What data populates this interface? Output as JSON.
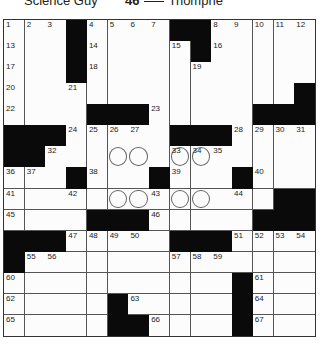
{
  "clue_strip": {
    "left_clue": {
      "text": "Science Guy"
    },
    "right_clue": {
      "number": "46",
      "blank": "___",
      "text": "Triomphe"
    }
  },
  "puzzle": {
    "rows": 15,
    "cols": 15,
    "colors": {
      "black": "#0a0a0a",
      "white": "#fcfcfc",
      "line": "#555555"
    },
    "grid": [
      "...#....##.....",
      "...#.....#.....",
      "...#...........",
      "..............#",
      "....###.....###",
      "###.....###....",
      "##.............",
      "...#...#...#...",
      ".............##",
      "....###.....###",
      "###.....###....",
      "#..............",
      "...........#...",
      ".....#.....#...",
      ".....##....#..."
    ],
    "numbers": [
      {
        "r": 0,
        "c": 0,
        "n": "1"
      },
      {
        "r": 0,
        "c": 1,
        "n": "2"
      },
      {
        "r": 0,
        "c": 2,
        "n": "3"
      },
      {
        "r": 0,
        "c": 4,
        "n": "4"
      },
      {
        "r": 0,
        "c": 5,
        "n": "5"
      },
      {
        "r": 0,
        "c": 6,
        "n": "6"
      },
      {
        "r": 0,
        "c": 7,
        "n": "7"
      },
      {
        "r": 0,
        "c": 10,
        "n": "8"
      },
      {
        "r": 0,
        "c": 11,
        "n": "9"
      },
      {
        "r": 0,
        "c": 12,
        "n": "10"
      },
      {
        "r": 0,
        "c": 13,
        "n": "11"
      },
      {
        "r": 0,
        "c": 14,
        "n": "12"
      },
      {
        "r": 1,
        "c": 0,
        "n": "13"
      },
      {
        "r": 1,
        "c": 4,
        "n": "14"
      },
      {
        "r": 1,
        "c": 8,
        "n": "15"
      },
      {
        "r": 1,
        "c": 10,
        "n": "16"
      },
      {
        "r": 2,
        "c": 0,
        "n": "17"
      },
      {
        "r": 2,
        "c": 4,
        "n": "18"
      },
      {
        "r": 2,
        "c": 9,
        "n": "19"
      },
      {
        "r": 3,
        "c": 0,
        "n": "20"
      },
      {
        "r": 3,
        "c": 3,
        "n": "21"
      },
      {
        "r": 4,
        "c": 0,
        "n": "22"
      },
      {
        "r": 4,
        "c": 7,
        "n": "23"
      },
      {
        "r": 5,
        "c": 3,
        "n": "24"
      },
      {
        "r": 5,
        "c": 4,
        "n": "25"
      },
      {
        "r": 5,
        "c": 5,
        "n": "26"
      },
      {
        "r": 5,
        "c": 6,
        "n": "27"
      },
      {
        "r": 5,
        "c": 11,
        "n": "28"
      },
      {
        "r": 5,
        "c": 12,
        "n": "29"
      },
      {
        "r": 5,
        "c": 13,
        "n": "30"
      },
      {
        "r": 5,
        "c": 14,
        "n": "31"
      },
      {
        "r": 6,
        "c": 2,
        "n": "32"
      },
      {
        "r": 6,
        "c": 8,
        "n": "33"
      },
      {
        "r": 6,
        "c": 9,
        "n": "34"
      },
      {
        "r": 6,
        "c": 10,
        "n": "35"
      },
      {
        "r": 7,
        "c": 0,
        "n": "36"
      },
      {
        "r": 7,
        "c": 1,
        "n": "37"
      },
      {
        "r": 7,
        "c": 4,
        "n": "38"
      },
      {
        "r": 7,
        "c": 8,
        "n": "39"
      },
      {
        "r": 7,
        "c": 12,
        "n": "40"
      },
      {
        "r": 8,
        "c": 0,
        "n": "41"
      },
      {
        "r": 8,
        "c": 3,
        "n": "42"
      },
      {
        "r": 8,
        "c": 7,
        "n": "43"
      },
      {
        "r": 8,
        "c": 11,
        "n": "44"
      },
      {
        "r": 9,
        "c": 0,
        "n": "45"
      },
      {
        "r": 9,
        "c": 7,
        "n": "46"
      },
      {
        "r": 10,
        "c": 3,
        "n": "47"
      },
      {
        "r": 10,
        "c": 4,
        "n": "48"
      },
      {
        "r": 10,
        "c": 5,
        "n": "49"
      },
      {
        "r": 10,
        "c": 6,
        "n": "50"
      },
      {
        "r": 10,
        "c": 11,
        "n": "51"
      },
      {
        "r": 10,
        "c": 12,
        "n": "52"
      },
      {
        "r": 10,
        "c": 13,
        "n": "53"
      },
      {
        "r": 10,
        "c": 14,
        "n": "54"
      },
      {
        "r": 11,
        "c": 1,
        "n": "55"
      },
      {
        "r": 11,
        "c": 2,
        "n": "56"
      },
      {
        "r": 11,
        "c": 8,
        "n": "57"
      },
      {
        "r": 11,
        "c": 9,
        "n": "58"
      },
      {
        "r": 11,
        "c": 10,
        "n": "59"
      },
      {
        "r": 12,
        "c": 0,
        "n": "60"
      },
      {
        "r": 12,
        "c": 12,
        "n": "61"
      },
      {
        "r": 13,
        "c": 0,
        "n": "62"
      },
      {
        "r": 13,
        "c": 6,
        "n": "63"
      },
      {
        "r": 13,
        "c": 12,
        "n": "64"
      },
      {
        "r": 14,
        "c": 0,
        "n": "65"
      },
      {
        "r": 14,
        "c": 7,
        "n": "66"
      },
      {
        "r": 14,
        "c": 12,
        "n": "67"
      }
    ],
    "circles": [
      {
        "r": 6,
        "c": 5
      },
      {
        "r": 6,
        "c": 6
      },
      {
        "r": 6,
        "c": 8
      },
      {
        "r": 6,
        "c": 9
      },
      {
        "r": 8,
        "c": 5
      },
      {
        "r": 8,
        "c": 6
      },
      {
        "r": 8,
        "c": 8
      },
      {
        "r": 8,
        "c": 9
      }
    ]
  }
}
